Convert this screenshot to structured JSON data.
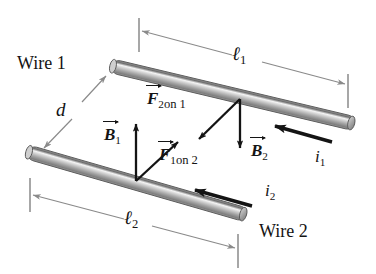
{
  "figure": {
    "background": "#ffffff",
    "width": 376,
    "height": 274
  },
  "colors": {
    "ink": "#141414",
    "dimension_line": "#8a8a8a",
    "wire_dark": "#6f6f6f",
    "wire_mid": "#a8a8a8",
    "wire_light": "#efefef",
    "wire_outline": "#5a5a5a"
  },
  "labels": {
    "wire1": "Wire 1",
    "wire2": "Wire 2",
    "length1": "ℓ",
    "length1_sub": "1",
    "length2": "ℓ",
    "length2_sub": "2",
    "separation": "d",
    "force_2_on_1": "F",
    "force_2_on_1_sub": "2 on 1",
    "force_1_on_2": "F",
    "force_1_on_2_sub": "1 on 2",
    "field_B1": "B",
    "field_B1_sub": "1",
    "field_B2": "B",
    "field_B2_sub": "2",
    "current_i1": "i",
    "current_i1_sub": "1",
    "current_i2": "i",
    "current_i2_sub": "2"
  },
  "force_parts": {
    "f2on1_num": "2",
    "f2on1_on": "on",
    "f2on1_target": "1",
    "f1on2_num": "1",
    "f1on2_on": "on",
    "f1on2_target": "2"
  },
  "geometry": {
    "wire1": {
      "x1": 112,
      "y1": 66,
      "x2": 355,
      "y2": 124,
      "radius": 7
    },
    "wire2": {
      "x1": 28,
      "y1": 152,
      "x2": 246,
      "y2": 215,
      "radius": 7
    },
    "vertex_on_wire1": {
      "x": 240,
      "y": 97
    },
    "vertex_on_wire2": {
      "x": 136,
      "y": 180
    },
    "vector_F2on1": {
      "x1": 240,
      "y1": 97,
      "x2": 196,
      "y2": 140
    },
    "vector_B2": {
      "x1": 240,
      "y1": 97,
      "x2": 240,
      "y2": 152
    },
    "vector_B1": {
      "x1": 136,
      "y1": 180,
      "x2": 136,
      "y2": 122
    },
    "vector_F1on2": {
      "x1": 136,
      "y1": 180,
      "x2": 180,
      "y2": 140
    },
    "current_i1_arrow": {
      "x1": 330,
      "y1": 141,
      "x2": 272,
      "y2": 126
    },
    "current_i2_arrow": {
      "x1": 250,
      "y1": 205,
      "x2": 192,
      "y2": 190
    },
    "dim_l1": {
      "x1": 139,
      "y1": 31,
      "x2": 348,
      "y2": 86
    },
    "dim_l2": {
      "x1": 30,
      "y1": 194,
      "x2": 238,
      "y2": 250
    },
    "dim_d": {
      "x1": 106,
      "y1": 76,
      "x2": 42,
      "y2": 146
    }
  },
  "physics": {
    "description": "Wire 1 carries current i1 to the left; Wire 2 carries current i2 to the left. Wire 1 is separated from Wire 2 by distance d. Field B1 from wire 1 points up at wire 2; field B2 from wire 2 points down at wire 1. The wires attract: F2 on 1 points toward wire 2 and F1 on 2 points toward wire 1."
  }
}
